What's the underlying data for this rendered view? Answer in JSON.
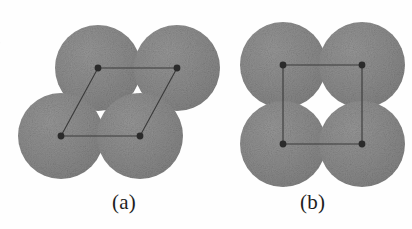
{
  "figure": {
    "background_color": "#fefefe",
    "sphere_fill": "#8a8a8a",
    "sphere_fill_dark": "#7b7b7b",
    "line_color": "#3a3a3a",
    "vertex_color": "#2b2b2b",
    "caption_color": "#1d1d1d",
    "panels": [
      {
        "id": "a",
        "label": "(a)",
        "packing": "rhombic",
        "circle_radius": 43,
        "circles": [
          {
            "cx": 98,
            "cy": 68
          },
          {
            "cx": 177,
            "cy": 68
          },
          {
            "cx": 61,
            "cy": 136
          },
          {
            "cx": 140,
            "cy": 136
          }
        ],
        "cell_vertices": [
          {
            "x": 98,
            "y": 68
          },
          {
            "x": 177,
            "y": 68
          },
          {
            "x": 140,
            "y": 136
          },
          {
            "x": 61,
            "y": 136
          }
        ]
      },
      {
        "id": "b",
        "label": "(b)",
        "packing": "square",
        "circle_radius": 43,
        "circles": [
          {
            "cx": 283,
            "cy": 65
          },
          {
            "cx": 362,
            "cy": 65
          },
          {
            "cx": 283,
            "cy": 144
          },
          {
            "cx": 362,
            "cy": 144
          }
        ],
        "cell_vertices": [
          {
            "x": 283,
            "y": 65
          },
          {
            "x": 362,
            "y": 65
          },
          {
            "x": 362,
            "y": 144
          },
          {
            "x": 283,
            "y": 144
          }
        ]
      }
    ],
    "margin_fragments": [
      {
        "text": "e",
        "top": 14
      },
      {
        "text": "o",
        "top": 38
      },
      {
        "text": "f",
        "top": 62
      },
      {
        "text": "t",
        "top": 76
      },
      {
        "text": "i",
        "top": 118
      },
      {
        "text": "s",
        "top": 150
      },
      {
        "text": "e",
        "top": 178
      },
      {
        "text": "a",
        "top": 206
      }
    ]
  }
}
